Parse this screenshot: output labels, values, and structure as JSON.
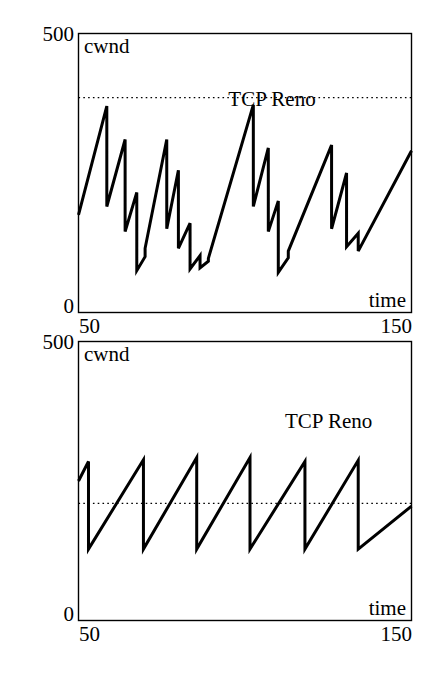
{
  "document": {
    "title": "TCP Reno congestion window evolution",
    "figure_count": 2,
    "background_color": "#ffffff",
    "ink_color": "#000000"
  },
  "chart_data": [
    {
      "id": "top",
      "type": "line",
      "title": "",
      "xlabel": "time",
      "ylabel": "cwnd",
      "series_label": "TCP Reno",
      "xlim": [
        50,
        150
      ],
      "ylim": [
        0,
        500
      ],
      "xticks": [
        50,
        150
      ],
      "xticklabels": [
        "50",
        "150"
      ],
      "yticks": [
        0,
        500
      ],
      "yticklabels": [
        "0",
        "500"
      ],
      "grid": false,
      "legend": "inline-annotation",
      "annotations": [
        {
          "text": "TCP Reno",
          "x": 95,
          "y": 370
        }
      ],
      "threshold": {
        "label": "",
        "value": 385,
        "style": "dotted"
      },
      "series": [
        {
          "name": "TCP Reno",
          "x": [
            50.0,
            58.5,
            58.5,
            64.0,
            64.0,
            67.5,
            67.5,
            70.0,
            70.0,
            76.5,
            76.5,
            80.0,
            80.0,
            83.5,
            83.5,
            86.5,
            86.5,
            89.0,
            89.0,
            102.5,
            102.5,
            107.0,
            107.0,
            110.0,
            110.0,
            113.0,
            113.0,
            126.0,
            126.0,
            130.5,
            130.5,
            134.0,
            134.0,
            150.0
          ],
          "y": [
            175.0,
            370.0,
            190.0,
            310.0,
            145.0,
            215.0,
            75.0,
            100.0,
            115.0,
            310.0,
            150.0,
            255.0,
            115.0,
            160.0,
            78.0,
            102.0,
            80.0,
            92.0,
            97.0,
            372.0,
            190.0,
            295.0,
            145.0,
            200.0,
            72.0,
            98.0,
            110.0,
            300.0,
            150.0,
            250.0,
            118.0,
            142.0,
            110.0,
            290.0
          ]
        }
      ]
    },
    {
      "id": "bottom",
      "type": "line",
      "title": "",
      "xlabel": "time",
      "ylabel": "cwnd",
      "series_label": "TCP Reno",
      "xlim": [
        50,
        150
      ],
      "ylim": [
        0,
        500
      ],
      "xticks": [
        50,
        150
      ],
      "xticklabels": [
        "50",
        "150"
      ],
      "yticks": [
        0,
        500
      ],
      "yticklabels": [
        "0",
        "500"
      ],
      "grid": false,
      "legend": "inline-annotation",
      "annotations": [
        {
          "text": "TCP Reno",
          "x": 112,
          "y": 345
        }
      ],
      "threshold": {
        "label": "",
        "value": 210,
        "style": "dotted"
      },
      "series": [
        {
          "name": "TCP Reno",
          "x": [
            50.0,
            53.0,
            53.0,
            69.5,
            69.5,
            85.5,
            85.5,
            101.5,
            101.5,
            118.0,
            118.0,
            134.0,
            134.0,
            150.0
          ],
          "y": [
            250.0,
            285.0,
            128.0,
            288.0,
            128.0,
            292.0,
            128.0,
            292.0,
            128.0,
            285.0,
            128.0,
            287.0,
            128.0,
            205.0
          ]
        }
      ]
    }
  ],
  "figures": [
    {
      "id": "top",
      "axis_labels": {
        "y_top": "500",
        "y_bottom": "0",
        "x_left": "50",
        "x_right": "150"
      },
      "y_axis_name": "cwnd",
      "x_axis_name": "time",
      "series_label": "TCP Reno"
    },
    {
      "id": "bottom",
      "axis_labels": {
        "y_top": "500",
        "y_bottom": "0",
        "x_left": "50",
        "x_right": "150"
      },
      "y_axis_name": "cwnd",
      "x_axis_name": "time",
      "series_label": "TCP Reno"
    }
  ]
}
